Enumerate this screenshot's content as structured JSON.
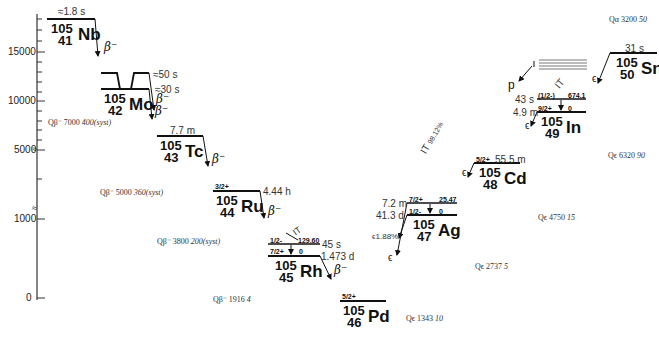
{
  "axis": {
    "ticks": [
      {
        "label": "15000",
        "y": 52
      },
      {
        "label": "10000",
        "y": 101
      },
      {
        "label": "5000",
        "y": 150
      },
      {
        "label": "1000",
        "y": 219
      },
      {
        "label": "0",
        "y": 298
      }
    ],
    "break_marks": [
      "≈",
      "≈"
    ]
  },
  "nuclides": [
    {
      "id": "nb",
      "A": "105",
      "Z": "41",
      "symbol": "Nb",
      "halflife": "≈1.8 s",
      "decay": "β⁻"
    },
    {
      "id": "mo",
      "A": "105",
      "Z": "42",
      "symbol": "Mo",
      "halflife_1": "≈50 s",
      "halflife_2": "≈30 s",
      "decay": "β⁻"
    },
    {
      "id": "tc",
      "A": "105",
      "Z": "43",
      "symbol": "Tc",
      "halflife": "7.7 m",
      "decay": "β⁻"
    },
    {
      "id": "ru",
      "A": "105",
      "Z": "44",
      "symbol": "Ru",
      "spin": "3/2+",
      "halflife": "4.44 h",
      "decay": "β⁻"
    },
    {
      "id": "rh",
      "A": "105",
      "Z": "45",
      "symbol": "Rh",
      "isomer_spin": "1/2-",
      "isomer_energy": "129.60",
      "isomer_halflife": "45 s",
      "isomer_decay": "IT",
      "gs_spin": "7/2+",
      "gs_energy": "0",
      "gs_halflife": "1.473 d",
      "decay": "β⁻"
    },
    {
      "id": "pd",
      "A": "105",
      "Z": "46",
      "symbol": "Pd",
      "spin": "5/2+"
    },
    {
      "id": "ag",
      "A": "105",
      "Z": "47",
      "symbol": "Ag",
      "isomer_spin": "7/2+",
      "isomer_energy": "25.47",
      "isomer_halflife": "7.2 m",
      "gs_spin": "1/2-",
      "gs_energy": "0",
      "gs_halflife": "41.3 d",
      "it_label": "IT",
      "it_branch": "98.12%",
      "ec_branch": "1.88%",
      "decay": "ϵ"
    },
    {
      "id": "cd",
      "A": "105",
      "Z": "48",
      "symbol": "Cd",
      "spin": "5/2+",
      "halflife": "55.5 m",
      "decay": "ϵ"
    },
    {
      "id": "in",
      "A": "105",
      "Z": "49",
      "symbol": "In",
      "isomer_spin": "(1/2-)",
      "isomer_energy": "674.1",
      "isomer_halflife": "43 s",
      "gs_spin": "9/2+",
      "gs_energy": "0",
      "gs_halflife": "4.9 m",
      "it_label": "IT",
      "p_label": "p",
      "decay": "ϵ"
    },
    {
      "id": "sn",
      "A": "105",
      "Z": "50",
      "symbol": "Sn",
      "halflife": "31 s",
      "decay": "ϵ"
    }
  ],
  "qvalues": [
    {
      "label": "Qβ⁻",
      "value": "7000",
      "unc": "400(syst)"
    },
    {
      "label": "Qβ⁻",
      "value": "5000",
      "unc": "360(syst)"
    },
    {
      "label": "Qβ⁻",
      "value": "3800",
      "unc": "200(syst)"
    },
    {
      "label": "Qβ⁻",
      "value": "1916",
      "unc": "4"
    },
    {
      "label": "Qϵ",
      "value": "1343",
      "unc": "10"
    },
    {
      "label": "Qϵ",
      "value": "2737",
      "unc": "5"
    },
    {
      "label": "Qϵ",
      "value": "4750",
      "unc": "15"
    },
    {
      "label": "Qϵ",
      "value": "6320",
      "unc": "90"
    },
    {
      "label": "Qα",
      "value": "3200",
      "unc": "50"
    }
  ]
}
